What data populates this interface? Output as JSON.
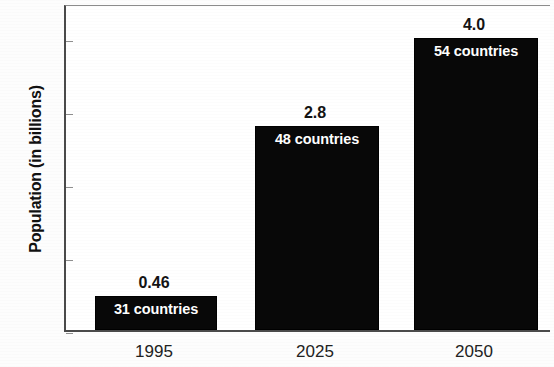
{
  "chart_data": {
    "type": "bar",
    "title": "",
    "xlabel": "",
    "ylabel": "Population (in billions)",
    "categories": [
      "1995",
      "2025",
      "2050"
    ],
    "values": [
      0.46,
      2.8,
      4.0
    ],
    "value_labels": [
      "0.46",
      "2.8",
      "4.0"
    ],
    "bar_annotations": [
      "31 countries",
      "48 countries",
      "54 countries"
    ],
    "series": [
      {
        "name": "Population (in billions)",
        "values": [
          0.46,
          2.8,
          4.0
        ]
      }
    ],
    "ylim": [
      0,
      4.5
    ],
    "y_ticks": [
      0,
      1,
      2,
      3,
      4
    ],
    "y_tick_labels": [
      "0",
      "1",
      "2",
      "3",
      "4"
    ],
    "grid": false,
    "legend": false,
    "legend_position": "none",
    "bar_color": "#080808",
    "bar_label_color": "#ffffff",
    "axis_color": "#4a4a4a",
    "background_color": "#ffffff"
  }
}
